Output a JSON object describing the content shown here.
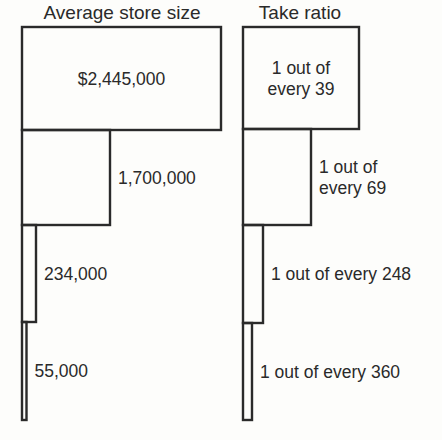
{
  "chart_data": {
    "type": "nested-rectangles",
    "panels": [
      {
        "title": "Average store size",
        "categories": [
          "Tier 1",
          "Tier 2",
          "Tier 3",
          "Tier 4"
        ],
        "values": [
          2445000,
          1700000,
          234000,
          55000
        ],
        "labels": [
          "$2,445,000",
          "1,700,000",
          "234,000",
          "55,000"
        ],
        "label_lines": [
          [
            "$2,445,000"
          ],
          [
            "1,700,000"
          ],
          [
            "234,000"
          ],
          [
            "55,000"
          ]
        ]
      },
      {
        "title": "Take ratio",
        "categories": [
          "Tier 1",
          "Tier 2",
          "Tier 3",
          "Tier 4"
        ],
        "values": [
          39,
          69,
          248,
          360
        ],
        "labels": [
          "1 out of every 39",
          "1 out of every 69",
          "1 out of every 248",
          "1 out of every 360"
        ],
        "label_lines": [
          [
            "1 out of",
            "every 39"
          ],
          [
            "1 out of",
            "every 69"
          ],
          [
            "1 out of every 248"
          ],
          [
            "1 out of every 360"
          ]
        ]
      }
    ],
    "colors": {
      "stroke": "#2a2a2a",
      "background": "#fdfdfb"
    }
  }
}
